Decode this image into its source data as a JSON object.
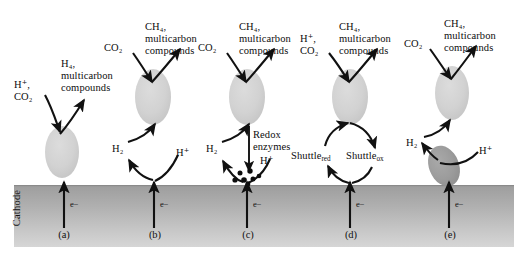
{
  "figure": {
    "cathode_label": "Cathode",
    "electron_label": "e−",
    "colors": {
      "cell_light": "#cfcfcf",
      "cell_dark": "#9d9d9d",
      "cathode_top": "#9f9f9f",
      "cathode_bottom": "#d2d2d2",
      "stroke": "#111111",
      "background": "#ffffff"
    }
  },
  "panels": [
    {
      "id": "a",
      "letter": "(a)",
      "caption": "Direct electron uptake from cathode",
      "input_label_line1": "H⁺,",
      "input_label_line2": "CO₂",
      "output_label_line1": "H₄,",
      "output_label_line2": "multicarbon",
      "output_label_line3": "compounds",
      "cells": 1
    },
    {
      "id": "b",
      "letter": "(b)",
      "caption": "Hydrogen mediated electron transfer",
      "input_label": "CO₂",
      "output_label_line1": "CH₄,",
      "output_label_line2": "multicarbon",
      "output_label_line3": "compounds",
      "mediator_label": "H₂",
      "proton_label": "H⁺",
      "cells": 1
    },
    {
      "id": "c",
      "letter": "(c)",
      "caption": "Redox enzyme catalysed hydrogen production",
      "input_label": "CO₂",
      "output_label_line1": "CH₄,",
      "output_label_line2": "multicarbon",
      "output_label_line3": "compounds",
      "mediator_label": "H₂",
      "proton_label": "H⁺",
      "enzyme_label_line1": "Redox",
      "enzyme_label_line2": "enzymes",
      "cells": 1
    },
    {
      "id": "d",
      "letter": "(d)",
      "caption": "Redox shuttle mediated electron transfer",
      "input_label_line1": "H⁺,",
      "input_label_line2": "CO₂",
      "output_label_line1": "CH₄,",
      "output_label_line2": "multicarbon",
      "output_label_line3": "compounds",
      "shuttle_reduced_base": "Shuttle",
      "shuttle_reduced_sub": "red",
      "shuttle_oxidised_base": "Shuttle",
      "shuttle_oxidised_sub": "ox",
      "cells": 1
    },
    {
      "id": "e",
      "letter": "(e)",
      "caption": "Syntrophic two-organism hydrogen exchange",
      "input_label": "CO₂",
      "output_label_line1": "CH₄,",
      "output_label_line2": "multicarbon",
      "output_label_line3": "compounds",
      "mediator_label": "H₂",
      "proton_label": "H⁺",
      "cells": 2
    }
  ]
}
